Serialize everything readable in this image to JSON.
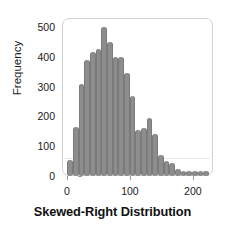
{
  "chart_data": {
    "type": "bar",
    "title": "Skewed-Right Distribution",
    "xlabel": "",
    "ylabel": "Frequency",
    "xlim": [
      -8,
      232
    ],
    "ylim": [
      0,
      530
    ],
    "grid": false,
    "legend": null,
    "bar_color": "#8d8d8d",
    "bar_edge_color": "#7a7a7a",
    "frame_color": "#d2d2d2",
    "text_color": "#1a1a1a",
    "bin_width": 9,
    "x_ticks": [
      0,
      100,
      200
    ],
    "y_ticks": [
      0,
      100,
      200,
      300,
      400,
      500
    ],
    "categories": [
      5,
      14,
      23,
      32,
      41,
      50,
      59,
      68,
      77,
      86,
      95,
      104,
      113,
      122,
      131,
      140,
      149,
      158,
      167,
      176,
      185,
      194,
      203,
      212,
      221
    ],
    "values": [
      55,
      165,
      310,
      390,
      415,
      425,
      500,
      450,
      400,
      400,
      345,
      270,
      155,
      160,
      195,
      140,
      70,
      50,
      45,
      25,
      10,
      8,
      8,
      8,
      8
    ],
    "series": [
      {
        "name": "Frequency",
        "values": [
          55,
          165,
          310,
          390,
          415,
          425,
          500,
          450,
          400,
          400,
          345,
          270,
          155,
          160,
          195,
          140,
          70,
          50,
          45,
          25,
          10,
          8,
          8,
          8,
          8
        ]
      }
    ]
  },
  "axis": {
    "y_label": "Frequency",
    "y_tick_labels": [
      "500",
      "400",
      "300",
      "200",
      "100",
      "0"
    ],
    "x_tick_labels": [
      "0",
      "100",
      "200"
    ]
  },
  "figure": {
    "title": "Skewed-Right Distribution"
  }
}
